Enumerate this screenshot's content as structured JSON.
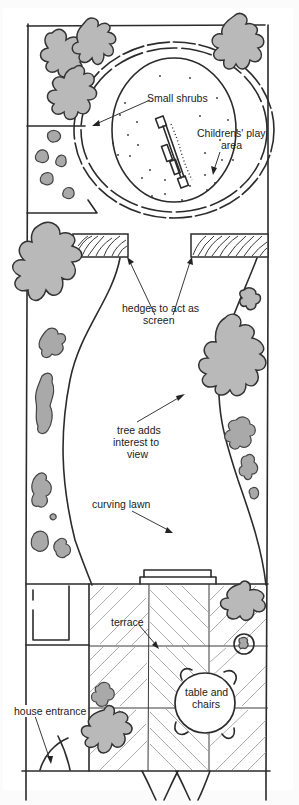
{
  "diagram": {
    "type": "garden-plan",
    "style": "hand-drawn sketch",
    "colors": {
      "ink": "#2b2b2b",
      "foliage": "#b9b9b9",
      "shrub": "#a9a9a9",
      "paving_hatch": "#9a9a9a",
      "background": "#ffffff"
    },
    "labels": {
      "small_shrubs": "Small shrubs",
      "play_area_line1": "Childrens' play",
      "play_area_line2": "area",
      "hedges_line1": "hedges to act as",
      "hedges_line2": "screen",
      "tree_line1": "tree adds",
      "tree_line2": "interest to",
      "tree_line3": "view",
      "curving_lawn": "curving lawn",
      "terrace": "terrace",
      "table_line1": "table and",
      "table_line2": "chairs",
      "house_entrance": "house entrance"
    },
    "elements": [
      {
        "name": "garden-boundary",
        "kind": "rectangle"
      },
      {
        "name": "childrens-play-area",
        "kind": "circle"
      },
      {
        "name": "swing-set",
        "kind": "play equipment"
      },
      {
        "name": "hedge-left",
        "kind": "hedge"
      },
      {
        "name": "hedge-right",
        "kind": "hedge"
      },
      {
        "name": "curving-lawn",
        "kind": "lawn"
      },
      {
        "name": "terrace",
        "kind": "paving"
      },
      {
        "name": "steps",
        "kind": "steps"
      },
      {
        "name": "table-and-chairs",
        "kind": "furniture"
      },
      {
        "name": "house-entrance",
        "kind": "door"
      },
      {
        "name": "trees",
        "kind": "tree",
        "count": 6
      },
      {
        "name": "small-shrubs",
        "kind": "shrub"
      }
    ]
  }
}
